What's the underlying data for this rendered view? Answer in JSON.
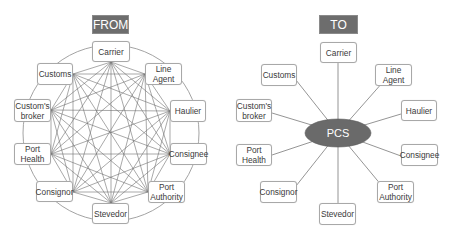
{
  "from_diagram": {
    "title": "FROM",
    "nodes": [
      {
        "id": "carrier",
        "label": "Carrier"
      },
      {
        "id": "line-agent",
        "label": "Line\nAgent"
      },
      {
        "id": "haulier",
        "label": "Haulier"
      },
      {
        "id": "consignee",
        "label": "Consignee"
      },
      {
        "id": "port-authority",
        "label": "Port\nAuthority"
      },
      {
        "id": "stevedor",
        "label": "Stevedor"
      },
      {
        "id": "consignor",
        "label": "Consignor"
      },
      {
        "id": "port-health",
        "label": "Port\nHealth"
      },
      {
        "id": "customs-broker",
        "label": "Custom's\nbroker"
      },
      {
        "id": "customs",
        "label": "Customs"
      }
    ],
    "topology": "full-mesh (every node connected to every other) plus ring"
  },
  "to_diagram": {
    "title": "TO",
    "hub": "PCS",
    "nodes": [
      {
        "id": "carrier",
        "label": "Carrier"
      },
      {
        "id": "line-agent",
        "label": "Line\nAgent"
      },
      {
        "id": "haulier",
        "label": "Haulier"
      },
      {
        "id": "consignee",
        "label": "Consignee"
      },
      {
        "id": "port-authority",
        "label": "Port\nAuthority"
      },
      {
        "id": "stevedor",
        "label": "Stevedor"
      },
      {
        "id": "consignor",
        "label": "Consignor"
      },
      {
        "id": "port-health",
        "label": "Port\nHealth"
      },
      {
        "id": "customs-broker",
        "label": "Custom's\nbroker"
      },
      {
        "id": "customs",
        "label": "Customs"
      }
    ],
    "topology": "hub-and-spoke (all nodes connect to PCS)"
  },
  "colors": {
    "header_bg": "#6d6d6d",
    "hub_fill": "#6a6a6a",
    "line": "#7a7a7a",
    "node_border": "#a8a8a8",
    "text": "#3a3a3a"
  }
}
